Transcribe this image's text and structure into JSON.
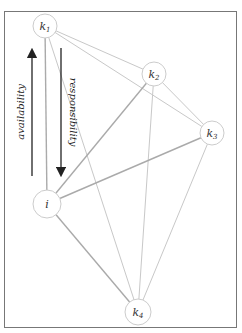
{
  "diagram": {
    "title": "",
    "nodes": [
      {
        "id": "k1",
        "label": "k",
        "sub": "1",
        "x": 45,
        "y": 26
      },
      {
        "id": "k2",
        "label": "k",
        "sub": "2",
        "x": 154,
        "y": 74
      },
      {
        "id": "k3",
        "label": "k",
        "sub": "3",
        "x": 212,
        "y": 133
      },
      {
        "id": "i",
        "label": "i",
        "sub": "",
        "x": 47,
        "y": 204
      },
      {
        "id": "k4",
        "label": "k",
        "sub": "4",
        "x": 138,
        "y": 312
      }
    ],
    "edges": [
      {
        "from": "k1",
        "to": "k2",
        "weight": "light"
      },
      {
        "from": "k1",
        "to": "k3",
        "weight": "light"
      },
      {
        "from": "k1",
        "to": "i",
        "weight": "medium"
      },
      {
        "from": "k1",
        "to": "k4",
        "weight": "light"
      },
      {
        "from": "k2",
        "to": "k3",
        "weight": "light"
      },
      {
        "from": "k2",
        "to": "i",
        "weight": "medium"
      },
      {
        "from": "k2",
        "to": "k4",
        "weight": "light"
      },
      {
        "from": "k3",
        "to": "i",
        "weight": "medium"
      },
      {
        "from": "k3",
        "to": "k4",
        "weight": "light"
      },
      {
        "from": "i",
        "to": "k4",
        "weight": "medium"
      }
    ],
    "arrows": [
      {
        "name": "availability",
        "label": "availability",
        "direction": "up"
      },
      {
        "name": "responsibility",
        "label": "responsibility",
        "direction": "down"
      }
    ],
    "colors": {
      "frame": "#777777",
      "node_stroke": "#cccccc",
      "edge_light": "#c8c8c8",
      "edge_medium": "#aaaaaa",
      "arrow": "#222222"
    }
  }
}
